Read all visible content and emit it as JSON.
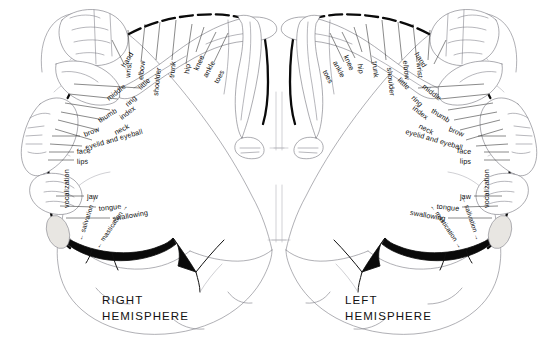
{
  "figure": {
    "background_color": "#ffffff",
    "ink_color": "#0d0d0d",
    "outline_color": "#7e7e86"
  },
  "hemispheres": {
    "right": {
      "line1": "RIGHT",
      "line2": "HEMISPHERE"
    },
    "left": {
      "line1": "LEFT",
      "line2": "HEMISPHERE"
    }
  },
  "labels_right_hemisphere": [
    "toes",
    "ankle",
    "knee",
    "hip",
    "trunk",
    "shoulder",
    "elbow",
    "wrist",
    "hand",
    "little",
    "ring",
    "middle",
    "index",
    "thumb",
    "neck",
    "brow",
    "eyelid and eyeball",
    "face",
    "lips",
    "vocalization",
    "jaw",
    "tongue",
    "swallowing",
    "salivation",
    "mastication"
  ],
  "labels_left_hemisphere": [
    "toes",
    "ankle",
    "knee",
    "hip",
    "trunk",
    "shoulder",
    "elbow",
    "wrist",
    "hand",
    "little",
    "ring",
    "middle",
    "index",
    "thumb",
    "neck",
    "brow",
    "eyelid and eyeball",
    "face",
    "lips",
    "vocalization",
    "jaw",
    "tongue",
    "swallowing",
    "salivation",
    "mastication"
  ],
  "right_arc": {
    "toes": "toes",
    "ankle": "ankle",
    "knee": "knee",
    "hip": "hip",
    "trunk": "trunk",
    "shoulder": "shoulder",
    "elbow": "elbow",
    "wrist": "wrist",
    "hand": "hand",
    "little": "little",
    "ring": "ring",
    "middle": "middle",
    "index": "index",
    "thumb": "thumb",
    "neck": "neck",
    "brow": "brow",
    "eyelid_and_eyeball": "eyelid and eyeball",
    "face": "face",
    "lips": "lips",
    "vocalization": "vocalization",
    "jaw": "jaw",
    "tongue": "tongue",
    "swallowing": "swallowing",
    "salivation": "← salivation →",
    "mastication": "← mastication →"
  },
  "left_arc": {
    "toes": "toes",
    "ankle": "ankle",
    "knee": "knee",
    "hip": "hip",
    "trunk": "trunk",
    "shoulder": "shoulder",
    "elbow": "elbow",
    "wrist": "wrist",
    "hand": "hand",
    "little": "little",
    "ring": "ring",
    "middle": "middle",
    "index": "index",
    "thumb": "thumb",
    "neck": "neck",
    "brow": "brow",
    "eyelid_and_eyeball": "eyelid and eyeball",
    "face": "face",
    "lips": "lips",
    "vocalization": "vocalization",
    "jaw": "jaw",
    "tongue": "tongue",
    "swallowing": "swallowing",
    "salivation": "← salivation →",
    "mastication": "← mastication →"
  }
}
